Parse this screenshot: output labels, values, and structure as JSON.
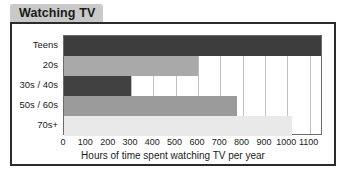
{
  "title": "Watching TV",
  "chart_data": {
    "type": "bar",
    "orientation": "horizontal",
    "title": "Watching TV",
    "xlabel": "Hours of time spent watching TV per year",
    "ylabel": "",
    "categories": [
      "Teens",
      "20s",
      "30s / 40s",
      "50s / 60s",
      "70s+"
    ],
    "values": [
      1150,
      600,
      300,
      775,
      1020
    ],
    "colors": [
      "#3c3c3c",
      "#a9a9a9",
      "#414141",
      "#9b9b9b",
      "#e9e9e9"
    ],
    "xlim": [
      0,
      1160
    ],
    "xticks": [
      0,
      100,
      200,
      300,
      400,
      500,
      600,
      700,
      800,
      900,
      1000,
      1100
    ],
    "xticklabels": [
      "0",
      "100",
      "200",
      "300",
      "400",
      "500",
      "600",
      "700",
      "800",
      "900",
      "1000",
      "1100"
    ],
    "grid": "vertical",
    "legend": "none"
  },
  "style": {
    "title_tab_bg": "#c9c9c9",
    "frame_border": "#2b2b2b",
    "plot_border": "#6b6b6b",
    "gridline_color": "#c0c0c0",
    "text_color": "#1b1b1b",
    "background": "#ffffff"
  }
}
